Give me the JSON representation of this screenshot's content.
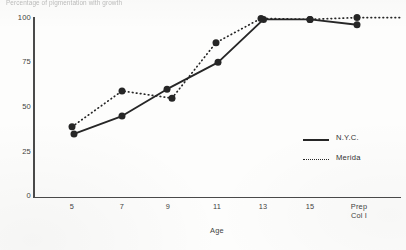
{
  "chart_data": {
    "type": "line",
    "title": "Percentage of pigmentation with growth",
    "xlabel": "Age",
    "ylabel": "",
    "categories": [
      "5",
      "7",
      "9",
      "11",
      "13",
      "15",
      "Prep\nCol I"
    ],
    "category_labels_flat": [
      "5",
      "7",
      "9",
      "11",
      "13",
      "15",
      "Prep Col I"
    ],
    "x_positions": [
      72,
      122,
      168,
      217,
      263,
      310,
      357
    ],
    "yticks": [
      0,
      25,
      50,
      75,
      100
    ],
    "ylim": [
      0,
      100
    ],
    "grid": false,
    "legend_position": "inside-right",
    "series": [
      {
        "name": "N.Y.C.",
        "style": "solid",
        "marker": "filled-circle",
        "values": [
          35,
          45,
          60,
          75,
          99,
          99,
          96
        ]
      },
      {
        "name": "Merida",
        "style": "dotted",
        "marker": "filled-circle",
        "values": [
          39,
          59,
          55,
          86,
          99,
          99,
          100
        ],
        "trailing_extension": {
          "to_x": 400,
          "to_value": 100,
          "note": "dotted line continues past last marker to plot edge"
        }
      }
    ]
  },
  "legend": {
    "items": [
      {
        "label": "N.Y.C.",
        "style": "solid"
      },
      {
        "label": "Merida",
        "style": "dotted"
      }
    ]
  },
  "axes": {
    "y_tick_labels": [
      "100",
      "75",
      "50",
      "25",
      "0"
    ],
    "x_tick_labels": [
      "5",
      "7",
      "9",
      "11",
      "13",
      "15",
      "Prep\nCol I"
    ],
    "x_axis_title": "Age"
  },
  "colors": {
    "ink": "#262626",
    "axis": "#4a4a4a",
    "text": "#3f3f3f",
    "background": "#fdfdfc"
  }
}
